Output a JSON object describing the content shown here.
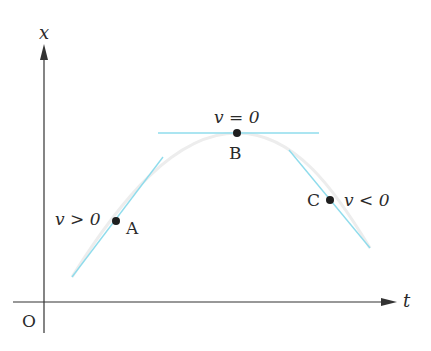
{
  "figure": {
    "axes": {
      "vertical_label": "x",
      "horizontal_label": "t",
      "origin_label": "O"
    },
    "points": [
      {
        "id": "A",
        "label": "A",
        "velocity_label": "v > 0"
      },
      {
        "id": "B",
        "label": "B",
        "velocity_label": "v = 0"
      },
      {
        "id": "C",
        "label": "C",
        "velocity_label": "v < 0"
      }
    ],
    "colors": {
      "tangent_line": "#8fdcec",
      "curve": "#ececec",
      "axis": "#333333",
      "dot": "#1e1e1e"
    }
  }
}
